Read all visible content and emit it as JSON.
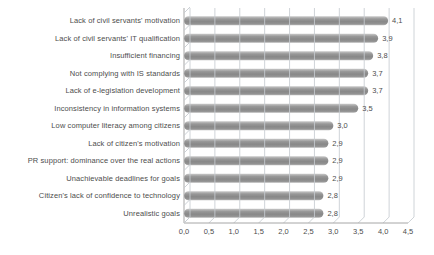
{
  "chart_data": {
    "type": "bar",
    "orientation": "horizontal",
    "title": "",
    "xlabel": "",
    "ylabel": "",
    "xlim": [
      0,
      4.5
    ],
    "x_tick_step": 0.5,
    "x_tick_labels": [
      "0,0",
      "0,5",
      "1,0",
      "1,5",
      "2,0",
      "2,5",
      "3,0",
      "3,5",
      "4,0",
      "4,5"
    ],
    "grid": true,
    "legend": false,
    "decimal_separator": ",",
    "value_labels_shown": true,
    "categories": [
      "Lack of civil servants' motivation",
      "Lack of civil servants' IT qualification",
      "Insufficient financing",
      "Not complying with IS standards",
      "Lack of e-legislation development",
      "Inconsistency in information systems",
      "Low computer literacy among citizens",
      "Lack of citizen's motivation",
      "PR support: dominance over the real actions",
      "Unachievable deadlines for goals",
      "Citizen's lack of confidence to technology",
      "Unrealistic goals"
    ],
    "values": [
      4.1,
      3.9,
      3.8,
      3.7,
      3.7,
      3.5,
      3.0,
      2.9,
      2.9,
      2.9,
      2.8,
      2.8
    ],
    "value_labels": [
      "4,1",
      "3,9",
      "3,8",
      "3,7",
      "3,7",
      "3,5",
      "3,0",
      "2,9",
      "2,9",
      "2,9",
      "2,8",
      "2,8"
    ],
    "colors": {
      "bar": "#8f8f8f",
      "bar_highlight": "#c9c9c9",
      "bar_shadow": "#7e7e7e",
      "grid": "#c7ccd1",
      "axis": "#a6a6a6",
      "text": "#4d4d4d",
      "background": "#ffffff"
    }
  }
}
